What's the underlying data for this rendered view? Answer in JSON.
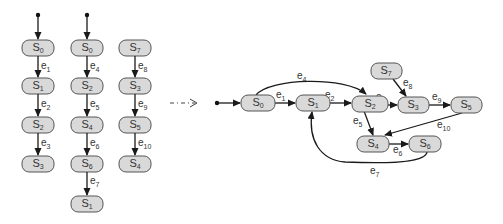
{
  "diagram": {
    "type": "state-machine-traces-merged",
    "traces": [
      {
        "id": "trace-1",
        "states": [
          "S0",
          "S1",
          "S2",
          "S3"
        ],
        "events": [
          "e1",
          "e2",
          "e3"
        ],
        "has_initial_marker": true
      },
      {
        "id": "trace-2",
        "states": [
          "S0",
          "S2",
          "S4",
          "S6",
          "S1"
        ],
        "events": [
          "e4",
          "e5",
          "e6",
          "e7"
        ],
        "has_initial_marker": true
      },
      {
        "id": "trace-3",
        "states": [
          "S7",
          "S3",
          "S5",
          "S4"
        ],
        "events": [
          "e8",
          "e9",
          "e10"
        ],
        "has_initial_marker": false
      }
    ],
    "transform_arrow": "- · - >",
    "merged_graph": {
      "initial_state": "S0",
      "states": [
        "S0",
        "S1",
        "S2",
        "S3",
        "S4",
        "S5",
        "S6",
        "S7"
      ],
      "edges": [
        {
          "from": "S0",
          "to": "S1",
          "label": "e1"
        },
        {
          "from": "S1",
          "to": "S2",
          "label": "e2"
        },
        {
          "from": "S2",
          "to": "S3",
          "label": "e3"
        },
        {
          "from": "S0",
          "to": "S2",
          "label": "e4"
        },
        {
          "from": "S2",
          "to": "S4",
          "label": "e5"
        },
        {
          "from": "S4",
          "to": "S6",
          "label": "e6"
        },
        {
          "from": "S6",
          "to": "S1",
          "label": "e7"
        },
        {
          "from": "S7",
          "to": "S3",
          "label": "e8"
        },
        {
          "from": "S3",
          "to": "S5",
          "label": "e9"
        },
        {
          "from": "S5",
          "to": "S4",
          "label": "e10"
        }
      ]
    }
  },
  "labels": {
    "S": "S",
    "e": "e",
    "n0": "0",
    "n1": "1",
    "n2": "2",
    "n3": "3",
    "n4": "4",
    "n5": "5",
    "n6": "6",
    "n7": "7",
    "n8": "8",
    "n9": "9",
    "n10": "10"
  },
  "colors": {
    "node_fill": "#d9d9d9",
    "node_stroke": "#555555",
    "edge": "#1a1a1a",
    "text": "#333333"
  }
}
